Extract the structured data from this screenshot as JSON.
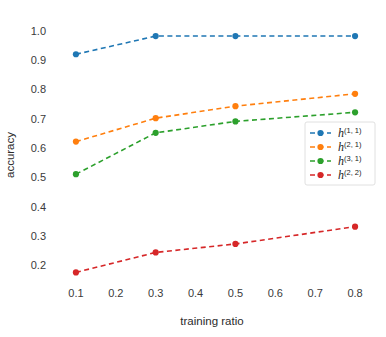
{
  "chart_data": {
    "type": "line",
    "title": "",
    "xlabel": "training ratio",
    "ylabel": "accuracy",
    "xlim": [
      0.05,
      0.85
    ],
    "ylim": [
      0.15,
      1.03
    ],
    "xticks": [
      "0.1",
      "0.2",
      "0.3",
      "0.4",
      "0.5",
      "0.6",
      "0.7",
      "0.8"
    ],
    "xtick_values": [
      0.1,
      0.2,
      0.3,
      0.4,
      0.5,
      0.6,
      0.7,
      0.8
    ],
    "yticks": [
      "0.2",
      "0.3",
      "0.4",
      "0.5",
      "0.6",
      "0.7",
      "0.8",
      "0.9",
      "1.0"
    ],
    "ytick_values": [
      0.2,
      0.3,
      0.4,
      0.5,
      0.6,
      0.7,
      0.8,
      0.9,
      1.0
    ],
    "grid": false,
    "legend_position": "center right",
    "linestyle": "dashed",
    "marker": "circle",
    "x": [
      0.1,
      0.3,
      0.5,
      0.8
    ],
    "series": [
      {
        "name": "h",
        "superscript": "(1, 1)",
        "label": "h(1, 1)",
        "color": "#1f77b4",
        "values": [
          0.92,
          0.982,
          0.982,
          0.982
        ]
      },
      {
        "name": "h",
        "superscript": "(2, 1)",
        "label": "h(2, 1)",
        "color": "#ff7f0e",
        "values": [
          0.622,
          0.702,
          0.743,
          0.785
        ]
      },
      {
        "name": "h",
        "superscript": "(3, 1)",
        "label": "h(3, 1)",
        "color": "#2ca02c",
        "values": [
          0.511,
          0.652,
          0.691,
          0.722
        ]
      },
      {
        "name": "h",
        "superscript": "(2, 2)",
        "label": "h(2, 2)",
        "color": "#d62728",
        "values": [
          0.176,
          0.244,
          0.273,
          0.332
        ]
      }
    ]
  },
  "colors": {
    "background": "#ffffff",
    "text": "#2b2b2b",
    "legend_border": "#d8d8d8"
  }
}
